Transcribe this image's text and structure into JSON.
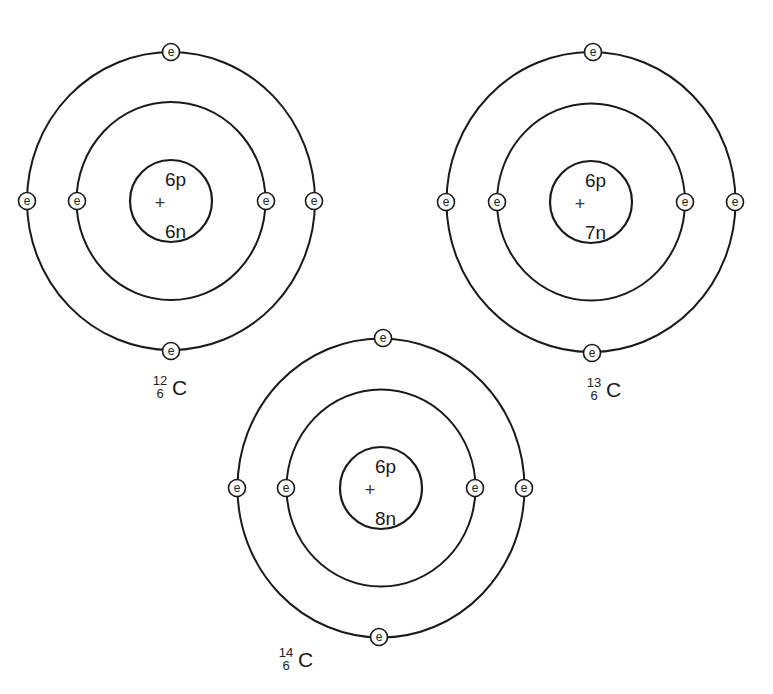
{
  "diagram": {
    "colors": {
      "line": "#1a1a1a",
      "background": "#ffffff"
    },
    "electron_label": "e",
    "atoms": [
      {
        "id": "carbon-12",
        "center": [
          171,
          201
        ],
        "outer_shell": {
          "rx": 144,
          "ry": 149
        },
        "inner_shell": {
          "rx": 94.5,
          "ry": 99
        },
        "nucleus_radius": 41,
        "nucleus": {
          "protons": "6p",
          "neutrons": "6n",
          "charge_symbol": "+"
        },
        "electrons": [
          {
            "shell": "outer",
            "pos": [
              171,
              52
            ]
          },
          {
            "shell": "outer",
            "pos": [
              27,
              201
            ]
          },
          {
            "shell": "outer",
            "pos": [
              314,
              201
            ]
          },
          {
            "shell": "outer",
            "pos": [
              171,
              351
            ]
          },
          {
            "shell": "inner",
            "pos": [
              77,
              201
            ]
          },
          {
            "shell": "inner",
            "pos": [
              266,
              201
            ]
          }
        ],
        "label": {
          "mass_number": "12",
          "atomic_number": "6",
          "symbol": "C",
          "pos": [
            160,
            395
          ]
        }
      },
      {
        "id": "carbon-13",
        "center": [
          591,
          202
        ],
        "outer_shell": {
          "rx": 144.5,
          "ry": 150
        },
        "inner_shell": {
          "rx": 94,
          "ry": 98.5
        },
        "nucleus_radius": 41,
        "nucleus": {
          "protons": "6p",
          "neutrons": "7n",
          "charge_symbol": "+"
        },
        "electrons": [
          {
            "shell": "outer",
            "pos": [
              593,
              52
            ]
          },
          {
            "shell": "outer",
            "pos": [
              446,
              202
            ]
          },
          {
            "shell": "outer",
            "pos": [
              735,
              202
            ]
          },
          {
            "shell": "outer",
            "pos": [
              592,
              353
            ]
          },
          {
            "shell": "inner",
            "pos": [
              497,
              202
            ]
          },
          {
            "shell": "inner",
            "pos": [
              685,
              202
            ]
          }
        ],
        "label": {
          "mass_number": "13",
          "atomic_number": "6",
          "symbol": "C",
          "pos": [
            594,
            397
          ]
        }
      },
      {
        "id": "carbon-14",
        "center": [
          381,
          488
        ],
        "outer_shell": {
          "rx": 143.5,
          "ry": 149.5
        },
        "inner_shell": {
          "rx": 94.5,
          "ry": 98.5
        },
        "nucleus_radius": 41,
        "nucleus": {
          "protons": "6p",
          "neutrons": "8n",
          "charge_symbol": "+"
        },
        "electrons": [
          {
            "shell": "outer",
            "pos": [
              383,
              338
            ]
          },
          {
            "shell": "outer",
            "pos": [
              237,
              488
            ]
          },
          {
            "shell": "outer",
            "pos": [
              524,
              488
            ]
          },
          {
            "shell": "outer",
            "pos": [
              379,
              637
            ]
          },
          {
            "shell": "inner",
            "pos": [
              286,
              488
            ]
          },
          {
            "shell": "inner",
            "pos": [
              475,
              488
            ]
          }
        ],
        "label": {
          "mass_number": "14",
          "atomic_number": "6",
          "symbol": "C",
          "pos": [
            286,
            667
          ]
        }
      }
    ]
  }
}
